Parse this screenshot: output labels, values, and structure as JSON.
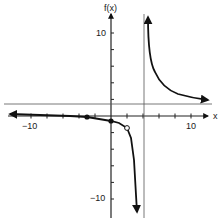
{
  "chart_data": {
    "type": "line",
    "title": "",
    "xlabel": "x",
    "ylabel": "f(x)",
    "xlim": [
      -12,
      12
    ],
    "ylim": [
      -12,
      12
    ],
    "x_tick_step": 2,
    "y_tick_step": 2,
    "x_tick_labels": [
      {
        "value": -10,
        "label": "−10"
      },
      {
        "value": 10,
        "label": "10"
      }
    ],
    "y_tick_labels": [
      {
        "value": 10,
        "label": "10"
      },
      {
        "value": -10,
        "label": "−10"
      }
    ],
    "grid": false,
    "asymptotes": {
      "vertical": [
        {
          "x": 4
        }
      ],
      "horizontal": [
        {
          "y": 1.5
        }
      ]
    },
    "series": [
      {
        "name": "left-branch",
        "points": [
          [
            -12,
            0.3
          ],
          [
            -8,
            0.2
          ],
          [
            -4,
            0.1
          ],
          [
            -2,
            0
          ],
          [
            0,
            -1
          ],
          [
            1,
            -2
          ],
          [
            2,
            -3
          ],
          [
            3,
            -6
          ],
          [
            3.4,
            -9
          ],
          [
            3.6,
            -12
          ]
        ],
        "arrow_left": true,
        "arrow_down": true
      },
      {
        "name": "right-branch",
        "points": [
          [
            4.4,
            11
          ],
          [
            4.6,
            8
          ],
          [
            5,
            6
          ],
          [
            6,
            4
          ],
          [
            7,
            3
          ],
          [
            8,
            2.5
          ],
          [
            10,
            2
          ],
          [
            11.5,
            1.8
          ]
        ],
        "arrow_up": true,
        "arrow_right": true
      }
    ],
    "marked_points": [
      {
        "x": -2,
        "y": 0,
        "style": "filled"
      },
      {
        "x": 0,
        "y": -1,
        "style": "filled"
      },
      {
        "x": 2,
        "y": -3,
        "style": "open"
      }
    ]
  },
  "labels": {
    "y_axis": "f(x)",
    "x_axis": "x",
    "y_pos10": "10",
    "y_neg10": "−10",
    "x_neg10": "−10",
    "x_pos10": "10"
  }
}
